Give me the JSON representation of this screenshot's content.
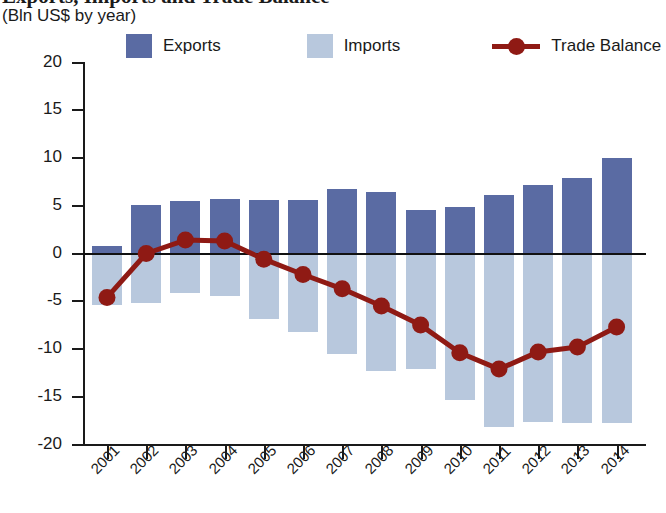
{
  "header": {
    "title_clipped": "Exports, Imports and Trade Balance",
    "subtitle": "(Bln US$ by year)"
  },
  "legend": {
    "items": [
      {
        "label": "Exports",
        "type": "swatch",
        "color": "#5a6ba3",
        "name": "legend-exports"
      },
      {
        "label": "Imports",
        "type": "swatch",
        "color": "#b8c8dd",
        "name": "legend-imports"
      },
      {
        "label": "Trade Balance",
        "type": "line",
        "color": "#8f1a14",
        "name": "legend-trade-balance"
      }
    ]
  },
  "colors": {
    "exports": "#5a6ba3",
    "imports": "#b8c8dd",
    "trade_balance": "#8f1a14",
    "axis": "#1a1a1a",
    "background": "#ffffff"
  },
  "chart_data": {
    "type": "bar",
    "title": "Exports, Imports and Trade Balance",
    "subtitle": "(Bln US$ by year)",
    "xlabel": "",
    "ylabel": "",
    "ylim": [
      -20,
      20
    ],
    "yticks": [
      20,
      15,
      10,
      5,
      0,
      -5,
      -10,
      -15,
      -20
    ],
    "ytick_labels": [
      "20",
      "15",
      "10",
      "5",
      "0",
      "-5",
      "-10",
      "-15",
      "-20"
    ],
    "grid": false,
    "legend_position": "top",
    "categories": [
      "2001",
      "2002",
      "2003",
      "2004",
      "2005",
      "2006",
      "2007",
      "2008",
      "2009",
      "2010",
      "2011",
      "2012",
      "2013",
      "2014"
    ],
    "series": [
      {
        "name": "Exports",
        "type": "bar",
        "color": "#5a6ba3",
        "values": [
          0.8,
          5.1,
          5.5,
          5.7,
          5.6,
          5.6,
          6.8,
          6.4,
          4.6,
          4.9,
          6.1,
          7.2,
          7.9,
          10.0
        ]
      },
      {
        "name": "Imports",
        "type": "bar",
        "color": "#b8c8dd",
        "values": [
          -5.4,
          -5.2,
          -4.1,
          -4.4,
          -6.9,
          -8.2,
          -10.5,
          -12.3,
          -12.1,
          -15.3,
          -18.2,
          -17.6,
          -17.7,
          -17.7
        ]
      },
      {
        "name": "Trade Balance",
        "type": "line",
        "color": "#8f1a14",
        "values": [
          -4.6,
          0.0,
          1.4,
          1.3,
          -0.6,
          -2.2,
          -3.7,
          -5.5,
          -7.5,
          -10.4,
          -12.1,
          -10.3,
          -9.8,
          -7.7
        ]
      }
    ]
  }
}
